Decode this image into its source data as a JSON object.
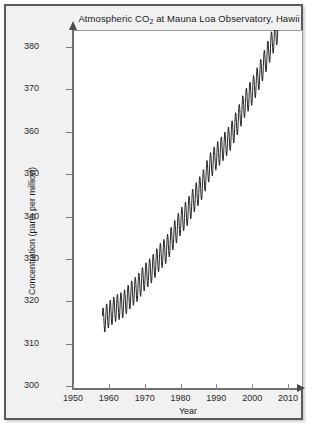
{
  "figure": {
    "title_prefix": "Atmospheric CO",
    "title_sub": "2",
    "title_suffix": " at Mauna Loa Observatory, Hawii",
    "title_full": "Atmospheric CO2 at Mauna Loa Observatory, Hawii"
  },
  "chart_data": {
    "type": "line",
    "title": "Atmospheric CO2 at Mauna Loa Observatory, Hawii",
    "xlabel": "Year",
    "ylabel": "Concentration (parts per million)",
    "xlim": [
      1950,
      2012
    ],
    "ylim": [
      300,
      384
    ],
    "xticks": [
      1950,
      1960,
      1970,
      1980,
      1990,
      2000,
      2010
    ],
    "xtick_labels": [
      "1950",
      "1960",
      "1970",
      "1980",
      "1990",
      "2000",
      "2010"
    ],
    "yticks": [
      300,
      310,
      320,
      330,
      340,
      350,
      360,
      370,
      380
    ],
    "ytick_labels": [
      "300",
      "310",
      "320",
      "330",
      "340",
      "350",
      "360",
      "370",
      "380"
    ],
    "grid": false,
    "legend": false,
    "line_color": "#111111",
    "line_width": 0.9,
    "series": [
      {
        "name": "Monthly mean CO2",
        "x_start": 1958.2,
        "x_end": 2007.4,
        "seasonal_amplitude_ppm": 3.1,
        "annual_trend": {
          "x": [
            1958,
            1960,
            1962,
            1964,
            1966,
            1968,
            1970,
            1972,
            1974,
            1976,
            1978,
            1980,
            1982,
            1984,
            1986,
            1988,
            1990,
            1992,
            1994,
            1996,
            1998,
            2000,
            2002,
            2004,
            2006,
            2007
          ],
          "y": [
            315.0,
            316.9,
            318.4,
            319.2,
            321.4,
            323.1,
            325.7,
            327.5,
            330.2,
            332.1,
            335.4,
            338.7,
            341.1,
            344.4,
            347.2,
            351.5,
            354.2,
            356.4,
            358.8,
            362.6,
            366.7,
            369.5,
            373.2,
            377.5,
            381.9,
            383.8
          ]
        }
      }
    ]
  },
  "axes": {
    "x_label": "Year",
    "y_label": "Concentration (parts per million)"
  }
}
